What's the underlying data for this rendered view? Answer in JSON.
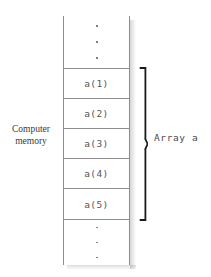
{
  "figure": {
    "type": "memory-array-diagram",
    "memory_label": {
      "line1": "Computer",
      "line2": "memory"
    },
    "array_label": "Array a",
    "column": {
      "top_ellipsis_dots": 3,
      "bottom_ellipsis_dots": 3,
      "cells": [
        {
          "label": "a(1)"
        },
        {
          "label": "a(2)"
        },
        {
          "label": "a(3)"
        },
        {
          "label": "a(4)"
        },
        {
          "label": "a(5)"
        }
      ]
    },
    "colors": {
      "border": "#8d8d8d",
      "cell_text": "#555555",
      "caption_text": "#3a3a3a",
      "brace": "#1a1a1a",
      "background": "#ffffff"
    }
  }
}
